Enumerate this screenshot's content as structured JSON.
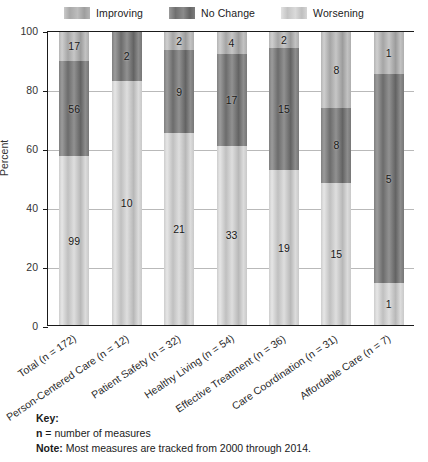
{
  "chart_data": {
    "type": "bar",
    "subtype": "100% stacked column",
    "title": "",
    "xlabel": "",
    "ylabel": "Percent",
    "ylim": [
      0,
      100
    ],
    "yticks": [
      0,
      20,
      40,
      60,
      80,
      100
    ],
    "grid": true,
    "legend_position": "top-center",
    "legend": [
      "Improving",
      "No Change",
      "Worsening"
    ],
    "categories": [
      "Total (n = 172)",
      "Person-Centered Care (n = 12)",
      "Patient Safety (n = 32)",
      "Healthy Living (n = 54)",
      "Effective Treatment (n = 36)",
      "Care Coordination (n = 31)",
      "Affordable Care (n = 7)"
    ],
    "category_totals": [
      172,
      12,
      32,
      54,
      36,
      31,
      7
    ],
    "series": [
      {
        "name": "Improving",
        "values": [
          17,
          0,
          2,
          4,
          2,
          8,
          1
        ],
        "percents": [
          9.9,
          0.0,
          6.3,
          7.4,
          5.6,
          25.8,
          14.3
        ]
      },
      {
        "name": "No Change",
        "values": [
          56,
          2,
          9,
          17,
          15,
          8,
          5
        ],
        "percents": [
          32.6,
          16.7,
          28.1,
          31.5,
          41.7,
          25.8,
          71.4
        ]
      },
      {
        "name": "Worsening",
        "values": [
          99,
          10,
          21,
          33,
          19,
          15,
          1
        ],
        "percents": [
          57.6,
          83.3,
          65.6,
          61.1,
          52.8,
          48.4,
          14.3
        ]
      }
    ],
    "colors": {
      "improving": "#b4b4b4",
      "no_change": "#7f7f7f",
      "worsening": "#cdcdcd",
      "axis": "#1a1a1a",
      "grid": "#b9b9b9"
    }
  },
  "key": {
    "title": "Key:",
    "n_symbol": "n",
    "n_definition": " = number of measures",
    "note_label": "Note:",
    "note_text": " Most measures are tracked from 2000 through 2014."
  }
}
